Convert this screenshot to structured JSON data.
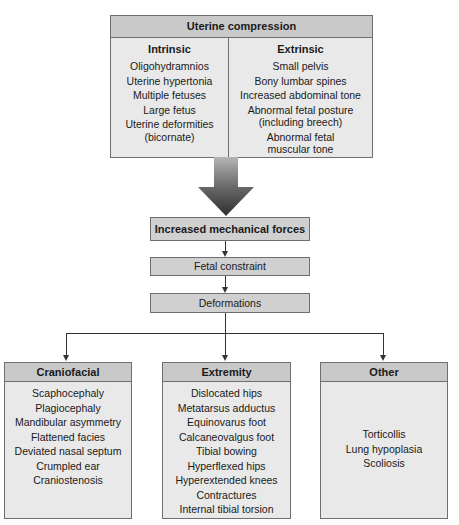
{
  "uterine_compression": {
    "title": "Uterine compression",
    "intrinsic": {
      "title": "Intrinsic",
      "items": [
        "Oligohydramnios",
        "Uterine hypertonia",
        "Multiple fetuses",
        "Large fetus",
        "Uterine deformities",
        "(bicornate)"
      ]
    },
    "extrinsic": {
      "title": "Extrinsic",
      "items": [
        "Small pelvis",
        "Bony lumbar spines",
        "Increased abdominal tone",
        "Abnormal fetal posture",
        "(including breech)",
        "Abnormal fetal",
        "muscular tone"
      ]
    }
  },
  "flow": {
    "mechanical_forces": "Increased mechanical forces",
    "fetal_constraint": "Fetal constraint",
    "deformations": "Deformations"
  },
  "categories": {
    "craniofacial": {
      "title": "Craniofacial",
      "items": [
        "Scaphocephaly",
        "Plagiocephaly",
        "Mandibular asymmetry",
        "Flattened facies",
        "Deviated nasal septum",
        "Crumpled ear",
        "Craniostenosis"
      ]
    },
    "extremity": {
      "title": "Extremity",
      "items": [
        "Dislocated hips",
        "Metatarsus adductus",
        "Equinovarus foot",
        "Calcaneovalgus foot",
        "Tibial bowing",
        "Hyperflexed hips",
        "Hyperextended knees",
        "Contractures",
        "Internal tibial torsion"
      ]
    },
    "other": {
      "title": "Other",
      "items": [
        "Torticollis",
        "Lung hypoplasia",
        "Scoliosis"
      ]
    }
  },
  "colors": {
    "header": "#c9c9c9",
    "body": "#e9e9e9",
    "border": "#6f6f6f",
    "connector": "#333333"
  }
}
